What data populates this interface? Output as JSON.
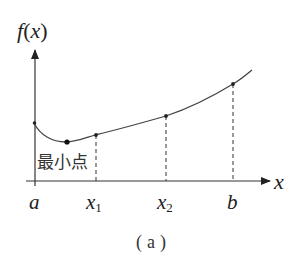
{
  "diagram": {
    "type": "function-graph",
    "y_axis_label": "f(x)",
    "y_axis_label_parts": {
      "f": "f",
      "open": "(",
      "x": "x",
      "close": ")"
    },
    "x_axis_label": "x",
    "min_point_label": "最小点",
    "caption": "（a）",
    "caption_parts": {
      "open": "(",
      "letter": "a",
      "close": ")"
    },
    "x_ticks": [
      {
        "name": "a",
        "label": "a",
        "sub": ""
      },
      {
        "name": "x1",
        "label": "x",
        "sub": "1"
      },
      {
        "name": "x2",
        "label": "x",
        "sub": "2"
      },
      {
        "name": "b",
        "label": "b",
        "sub": ""
      }
    ],
    "points": [
      {
        "name": "endpoint-a",
        "desc": "f(a)"
      },
      {
        "name": "minimum",
        "desc": "minimum point"
      },
      {
        "name": "point-x1",
        "desc": "f(x1)"
      },
      {
        "name": "point-x2",
        "desc": "f(x2)"
      },
      {
        "name": "endpoint-b",
        "desc": "f(b)"
      }
    ],
    "colors": {
      "stroke": "#333333",
      "text": "#222222",
      "background": "#ffffff"
    }
  }
}
